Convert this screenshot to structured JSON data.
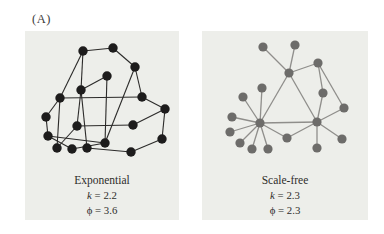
{
  "figure": {
    "panel_label": "(A)",
    "networks": [
      {
        "id": "exponential",
        "caption": "Exponential",
        "stats": [
          {
            "symbol": "k",
            "eq": "=",
            "value": "2.2"
          },
          {
            "symbol": "ϕ",
            "eq": "=",
            "value": "3.6"
          }
        ],
        "node_color": "#1d1c1c",
        "edge_color": "#2b2a29",
        "edge_width": 1.1,
        "node_radius": 4.7,
        "width": 154,
        "height": 189,
        "nodes": [
          [
            58,
            20
          ],
          [
            88,
            17
          ],
          [
            110,
            36
          ],
          [
            82,
            45
          ],
          [
            56,
            59
          ],
          [
            35,
            67
          ],
          [
            117,
            66
          ],
          [
            140,
            78
          ],
          [
            21,
            86
          ],
          [
            52,
            95
          ],
          [
            108,
            94
          ],
          [
            23,
            105
          ],
          [
            80,
            112
          ],
          [
            32,
            117
          ],
          [
            47,
            118
          ],
          [
            62,
            117
          ],
          [
            106,
            121
          ],
          [
            137,
            108
          ]
        ],
        "edges": [
          [
            0,
            1
          ],
          [
            1,
            2
          ],
          [
            0,
            4
          ],
          [
            0,
            5
          ],
          [
            2,
            6
          ],
          [
            2,
            12
          ],
          [
            3,
            4
          ],
          [
            3,
            12
          ],
          [
            4,
            9
          ],
          [
            4,
            15
          ],
          [
            5,
            6
          ],
          [
            5,
            8
          ],
          [
            5,
            13
          ],
          [
            6,
            7
          ],
          [
            7,
            10
          ],
          [
            7,
            17
          ],
          [
            8,
            11
          ],
          [
            9,
            10
          ],
          [
            9,
            13
          ],
          [
            11,
            12
          ],
          [
            11,
            14
          ],
          [
            12,
            14
          ],
          [
            15,
            16
          ],
          [
            16,
            17
          ]
        ]
      },
      {
        "id": "scale-free",
        "caption": "Scale-free",
        "stats": [
          {
            "symbol": "k",
            "eq": "=",
            "value": "2.3"
          },
          {
            "symbol": "ϕ",
            "eq": "=",
            "value": "2.3"
          }
        ],
        "node_color": "#6d6c6a",
        "edge_color": "#8f8e8b",
        "edge_width": 1.3,
        "node_radius": 4.6,
        "width": 166,
        "height": 189,
        "nodes": [
          [
            61,
            16
          ],
          [
            93,
            14
          ],
          [
            116,
            32
          ],
          [
            87,
            42
          ],
          [
            60,
            57
          ],
          [
            41,
            66
          ],
          [
            121,
            62
          ],
          [
            142,
            77
          ],
          [
            30,
            86
          ],
          [
            58,
            92
          ],
          [
            115,
            91
          ],
          [
            28,
            101
          ],
          [
            38,
            112
          ],
          [
            50,
            118
          ],
          [
            66,
            118
          ],
          [
            85,
            107
          ],
          [
            115,
            117
          ],
          [
            140,
            108
          ]
        ],
        "edges": [
          [
            0,
            3
          ],
          [
            1,
            3
          ],
          [
            2,
            3
          ],
          [
            2,
            6
          ],
          [
            2,
            7
          ],
          [
            3,
            9
          ],
          [
            3,
            10
          ],
          [
            6,
            10
          ],
          [
            7,
            10
          ],
          [
            9,
            4
          ],
          [
            9,
            5
          ],
          [
            9,
            8
          ],
          [
            9,
            11
          ],
          [
            9,
            12
          ],
          [
            9,
            13
          ],
          [
            9,
            14
          ],
          [
            9,
            15
          ],
          [
            9,
            10
          ],
          [
            10,
            15
          ],
          [
            10,
            16
          ],
          [
            10,
            17
          ]
        ]
      }
    ]
  }
}
